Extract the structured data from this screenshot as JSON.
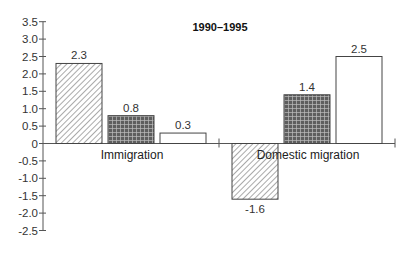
{
  "chart_data": {
    "type": "bar",
    "title": "1990–1995",
    "xlabel": "",
    "ylabel": "",
    "categories": [
      "Immigration",
      "Domestic migration"
    ],
    "series": [
      {
        "name": "Series 1 (diagonal hatch)",
        "pattern": "hatch",
        "values": [
          2.3,
          -1.6
        ]
      },
      {
        "name": "Series 2 (dark crosshatch)",
        "pattern": "crosshatch",
        "values": [
          0.8,
          1.4
        ]
      },
      {
        "name": "Series 3 (white)",
        "pattern": "white",
        "values": [
          0.3,
          2.5
        ]
      }
    ],
    "value_labels": [
      [
        "2.3",
        "0.8",
        "0.3"
      ],
      [
        "-1.6",
        "1.4",
        "2.5"
      ]
    ],
    "ylim": [
      -2.5,
      3.5
    ],
    "yticks": [
      3.5,
      3.0,
      2.5,
      2.0,
      1.5,
      1.0,
      0.5,
      0,
      -0.5,
      -1.0,
      -1.5,
      -2.0,
      -2.5
    ],
    "ytick_labels": [
      "3.5",
      "3.0",
      "2.5",
      "2.0",
      "1.5",
      "1.0",
      "0.5",
      "0",
      "-0.5",
      "-1.0",
      "-1.5",
      "-2.0",
      "-2.5"
    ],
    "grid": false,
    "legend": "none",
    "colors": {
      "axis": "#555555",
      "bar_stroke": "#444444",
      "crosshatch_fill": "#6b6b6b",
      "white_fill": "#ffffff"
    }
  }
}
